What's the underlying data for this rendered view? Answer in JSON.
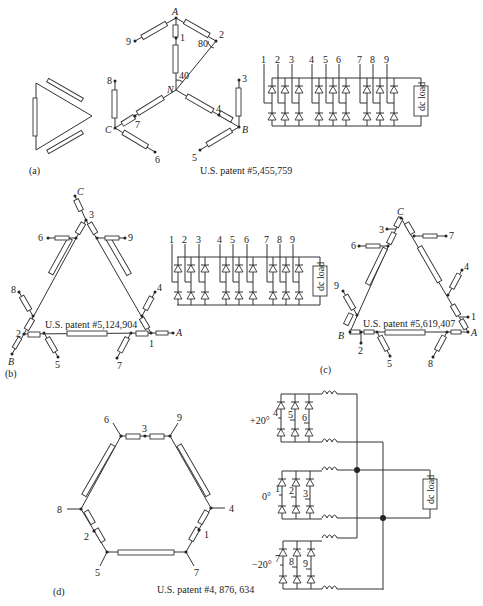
{
  "panels": {
    "a": {
      "label": "(a)",
      "patent": "U.S. patent #5,455,759",
      "nodes": {
        "A": "A",
        "B": "B",
        "C": "C",
        "N": "N"
      },
      "taps": [
        "1",
        "2",
        "3",
        "4",
        "5",
        "6",
        "7",
        "8",
        "9"
      ],
      "angles": {
        "outer": "80",
        "inner": "40"
      },
      "rectifier": {
        "inputs": [
          "1",
          "2",
          "3",
          "4",
          "5",
          "6",
          "7",
          "8",
          "9"
        ],
        "load": "dc load"
      }
    },
    "b": {
      "label": "(b)",
      "patent": "U.S. patent #5,124,904",
      "nodes": {
        "A": "A",
        "B": "B",
        "C": "C"
      },
      "taps": [
        "1",
        "2",
        "3",
        "4",
        "5",
        "6",
        "7",
        "8",
        "9"
      ],
      "rectifier": {
        "inputs": [
          "1",
          "2",
          "3",
          "4",
          "5",
          "6",
          "7",
          "8",
          "9"
        ],
        "load": "dc load"
      }
    },
    "c": {
      "label": "(c)",
      "patent": "U.S. patent #5,619,407",
      "nodes": {
        "A": "A",
        "B": "B",
        "C": "C"
      },
      "taps": [
        "1",
        "2",
        "3",
        "4",
        "5",
        "6",
        "7",
        "8",
        "9"
      ]
    },
    "d": {
      "label": "(d)",
      "patent": "U.S. patent #4, 876, 634",
      "taps": [
        "1",
        "2",
        "3",
        "4",
        "5",
        "6",
        "7",
        "8",
        "9"
      ],
      "bridges": [
        {
          "phase": "+20°",
          "inputs": [
            "4",
            "5",
            "6"
          ]
        },
        {
          "phase": "0°",
          "inputs": [
            "1",
            "2",
            "3"
          ]
        },
        {
          "phase": "−20°",
          "inputs": [
            "7",
            "8",
            "9"
          ]
        }
      ],
      "load": "dc load"
    }
  }
}
